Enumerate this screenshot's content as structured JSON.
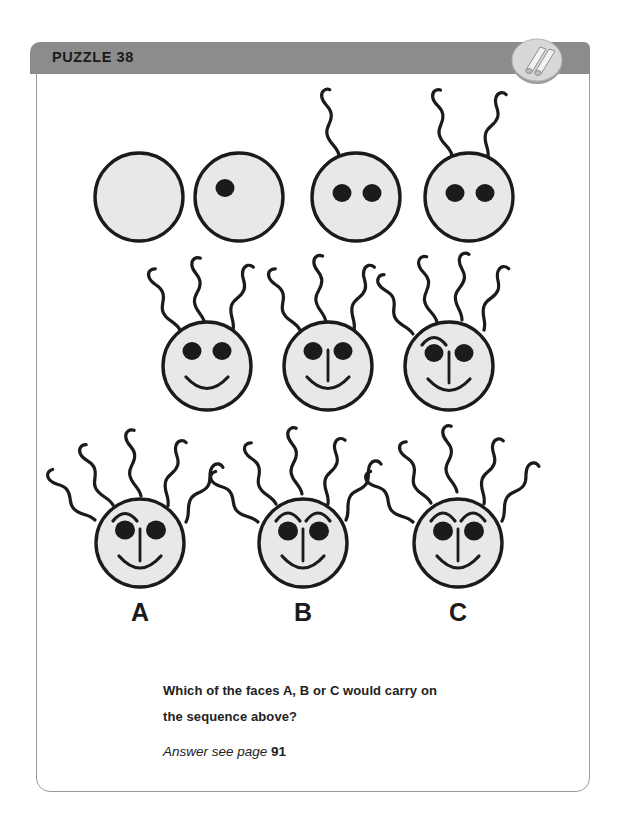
{
  "header": {
    "title": "PUZZLE 38",
    "bar_color": "#8c8c8c",
    "badge_icon": "rolled-paper-badge-icon"
  },
  "card": {
    "border_color": "#9a9a9a",
    "background": "#ffffff"
  },
  "puzzle": {
    "type": "visual-sequence",
    "face_fill": "#e8e8e8",
    "stroke_color": "#1b1b1b",
    "sequence": [
      {
        "index": 1,
        "row": 1,
        "eyes": 0,
        "hairs": 0,
        "nose": false,
        "mouth": false,
        "eyebrows": 0
      },
      {
        "index": 2,
        "row": 1,
        "eyes": 1,
        "hairs": 0,
        "nose": false,
        "mouth": false,
        "eyebrows": 0
      },
      {
        "index": 3,
        "row": 1,
        "eyes": 2,
        "hairs": 1,
        "nose": false,
        "mouth": false,
        "eyebrows": 0
      },
      {
        "index": 4,
        "row": 1,
        "eyes": 2,
        "hairs": 2,
        "nose": false,
        "mouth": false,
        "eyebrows": 0
      },
      {
        "index": 5,
        "row": 2,
        "eyes": 2,
        "hairs": 3,
        "nose": false,
        "mouth": true,
        "eyebrows": 0
      },
      {
        "index": 6,
        "row": 2,
        "eyes": 2,
        "hairs": 3,
        "nose": true,
        "mouth": true,
        "eyebrows": 0
      },
      {
        "index": 7,
        "row": 2,
        "eyes": 2,
        "hairs": 4,
        "nose": true,
        "mouth": true,
        "eyebrows": 1
      }
    ],
    "options": [
      {
        "label": "A",
        "eyes": 2,
        "hairs": 5,
        "nose": true,
        "mouth": true,
        "eyebrows": 1
      },
      {
        "label": "B",
        "eyes": 2,
        "hairs": 5,
        "nose": true,
        "mouth": true,
        "eyebrows": 2
      },
      {
        "label": "C",
        "eyes": 2,
        "hairs": 5,
        "nose": true,
        "mouth": true,
        "eyebrows": 2
      }
    ]
  },
  "question": {
    "line1": "Which of the faces A, B or C would carry on",
    "line2": "the sequence above?",
    "answer_prefix": "Answer see page ",
    "answer_page": "91"
  }
}
